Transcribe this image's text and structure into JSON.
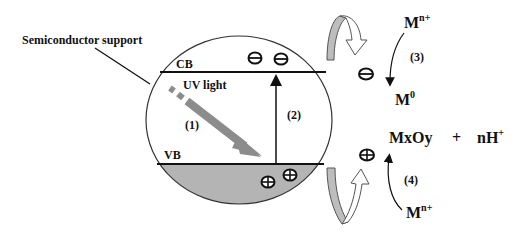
{
  "diagram": {
    "title_label": "Semiconductor support",
    "bands": {
      "conduction": "CB",
      "valence": "VB"
    },
    "light_label": "UV light",
    "steps": {
      "step1": "(1)",
      "step2": "(2)",
      "step3": "(3)",
      "step4": "(4)"
    },
    "species": {
      "metal_ion_top": "M",
      "metal_ion_top_sup": "n+",
      "metal_reduced": "M",
      "metal_reduced_sup": "0",
      "oxide": "MxOy",
      "plus": "+",
      "proton": "nH",
      "proton_sup": "+",
      "metal_ion_bottom": "M",
      "metal_ion_bottom_sup": "n+"
    },
    "charges": {
      "electron_symbol": "electron",
      "hole_symbol": "hole"
    },
    "colors": {
      "valence_fill": "#b4b4b4",
      "uv_arrow": "#8c8c8c",
      "curl_arrow_fill": "#bdbdbd",
      "line": "#111111"
    }
  }
}
